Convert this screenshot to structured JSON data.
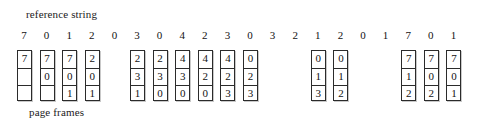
{
  "figure": {
    "top_caption": "reference string",
    "bottom_caption": "page frames",
    "frame_count": 3,
    "colors": {
      "ink": "#121212",
      "box_border": "#2b2b2b",
      "box_shadow": "#c9c9c9",
      "background": "#ffffff"
    },
    "layout": {
      "first_digit_x": 24,
      "digit_spacing": 22.6,
      "column_width": 15,
      "cell_height": 17
    }
  },
  "chart_data": {
    "type": "table",
    "title": "reference string",
    "xlabel": "reference string",
    "ylabel": "page frames",
    "grid": true,
    "legend": "none",
    "frame_count": 3,
    "reference_string": [
      7,
      0,
      1,
      2,
      0,
      3,
      0,
      4,
      2,
      3,
      0,
      3,
      2,
      1,
      2,
      0,
      1,
      7,
      0,
      1
    ],
    "steps": [
      {
        "index": 0,
        "reference": 7,
        "fault": true,
        "frames": [
          "7",
          "",
          ""
        ]
      },
      {
        "index": 1,
        "reference": 0,
        "fault": true,
        "frames": [
          "7",
          "0",
          ""
        ]
      },
      {
        "index": 2,
        "reference": 1,
        "fault": true,
        "frames": [
          "7",
          "0",
          "1"
        ]
      },
      {
        "index": 3,
        "reference": 2,
        "fault": true,
        "frames": [
          "2",
          "0",
          "1"
        ]
      },
      {
        "index": 4,
        "reference": 0,
        "fault": false,
        "frames": null
      },
      {
        "index": 5,
        "reference": 3,
        "fault": true,
        "frames": [
          "2",
          "3",
          "1"
        ]
      },
      {
        "index": 6,
        "reference": 0,
        "fault": true,
        "frames": [
          "2",
          "3",
          "0"
        ]
      },
      {
        "index": 7,
        "reference": 4,
        "fault": true,
        "frames": [
          "4",
          "3",
          "0"
        ]
      },
      {
        "index": 8,
        "reference": 2,
        "fault": true,
        "frames": [
          "4",
          "2",
          "0"
        ]
      },
      {
        "index": 9,
        "reference": 3,
        "fault": true,
        "frames": [
          "4",
          "2",
          "3"
        ]
      },
      {
        "index": 10,
        "reference": 0,
        "fault": true,
        "frames": [
          "0",
          "2",
          "3"
        ]
      },
      {
        "index": 11,
        "reference": 3,
        "fault": false,
        "frames": null
      },
      {
        "index": 12,
        "reference": 2,
        "fault": false,
        "frames": null
      },
      {
        "index": 13,
        "reference": 1,
        "fault": true,
        "frames": [
          "0",
          "1",
          "3"
        ]
      },
      {
        "index": 14,
        "reference": 2,
        "fault": true,
        "frames": [
          "0",
          "1",
          "2"
        ]
      },
      {
        "index": 15,
        "reference": 0,
        "fault": false,
        "frames": null
      },
      {
        "index": 16,
        "reference": 1,
        "fault": false,
        "frames": null
      },
      {
        "index": 17,
        "reference": 7,
        "fault": true,
        "frames": [
          "7",
          "1",
          "2"
        ]
      },
      {
        "index": 18,
        "reference": 0,
        "fault": true,
        "frames": [
          "7",
          "0",
          "2"
        ]
      },
      {
        "index": 19,
        "reference": 1,
        "fault": true,
        "frames": [
          "7",
          "0",
          "1"
        ]
      }
    ]
  }
}
